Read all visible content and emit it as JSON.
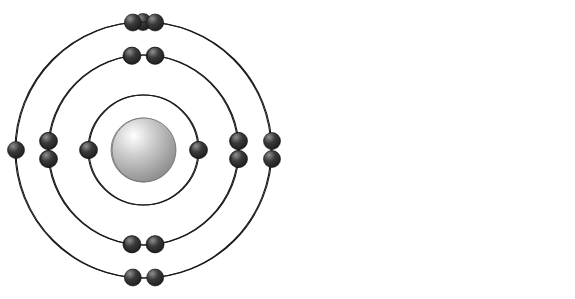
{
  "figure": {
    "background_color": "#ffffff",
    "width": 575,
    "height": 299
  },
  "style": {
    "shell_stroke_color": "#1a1a1a",
    "shell_stroke_width": 1.1,
    "electron_color_dark": "#1c1c1c",
    "electron_color_mid": "#3a3a3a",
    "electron_highlight": "#8f8f8f",
    "electron_radius": 8.5,
    "nucleus_color_light": "#ffffff",
    "nucleus_color_mid": "#cfcfcf",
    "nucleus_color_dark": "#8a8a8a",
    "nucleus_edge": "#6e6e6e"
  },
  "atoms": [
    {
      "id": "atom-left",
      "name": "sodium-atom",
      "label": "Sodium",
      "symbol": "Na",
      "atomic_number": 11,
      "center": {
        "x": 143,
        "y": 150
      },
      "nucleus_radius": 32,
      "electron_configuration": "2-8-1",
      "total_electrons": 11,
      "shells": [
        {
          "index": 1,
          "name": "inner-shell",
          "radius": 55,
          "electron_count": 2,
          "electrons": [
            {
              "angle_deg": 180,
              "pair_offset": 0
            },
            {
              "angle_deg": 0,
              "pair_offset": 0
            }
          ]
        },
        {
          "index": 2,
          "name": "middle-shell",
          "radius": 95,
          "electron_count": 8,
          "electrons": [
            {
              "angle_deg": 97,
              "pair_offset": 0
            },
            {
              "angle_deg": 83,
              "pair_offset": 0
            },
            {
              "angle_deg": 180,
              "pair_offset": -9
            },
            {
              "angle_deg": 180,
              "pair_offset": 9
            },
            {
              "angle_deg": 263,
              "pair_offset": 0
            },
            {
              "angle_deg": 277,
              "pair_offset": 0
            },
            {
              "angle_deg": 0,
              "pair_offset": -9
            },
            {
              "angle_deg": 0,
              "pair_offset": 9
            }
          ]
        },
        {
          "index": 3,
          "name": "outer-shell",
          "radius": 128,
          "electron_count": 1,
          "electrons": [
            {
              "angle_deg": 90,
              "pair_offset": 0
            }
          ]
        }
      ]
    },
    {
      "id": "atom-right",
      "name": "chlorine-atom",
      "label": "Chlorine",
      "symbol": "Cl",
      "atomic_number": 17,
      "center": {
        "x": 144,
        "y": 150
      },
      "nucleus_radius": 32,
      "electron_configuration": "2-8-7",
      "total_electrons": 17,
      "shells": [
        {
          "index": 1,
          "name": "inner-shell",
          "radius": 55,
          "electron_count": 2,
          "electrons": [
            {
              "angle_deg": 180,
              "pair_offset": 0
            },
            {
              "angle_deg": 0,
              "pair_offset": 0
            }
          ]
        },
        {
          "index": 2,
          "name": "middle-shell",
          "radius": 95,
          "electron_count": 8,
          "electrons": [
            {
              "angle_deg": 97,
              "pair_offset": 0
            },
            {
              "angle_deg": 83,
              "pair_offset": 0
            },
            {
              "angle_deg": 180,
              "pair_offset": -9
            },
            {
              "angle_deg": 180,
              "pair_offset": 9
            },
            {
              "angle_deg": 263,
              "pair_offset": 0
            },
            {
              "angle_deg": 277,
              "pair_offset": 0
            },
            {
              "angle_deg": 0,
              "pair_offset": -9
            },
            {
              "angle_deg": 0,
              "pair_offset": 9
            }
          ]
        },
        {
          "index": 3,
          "name": "outer-shell",
          "radius": 128,
          "electron_count": 7,
          "electrons": [
            {
              "angle_deg": 95,
              "pair_offset": 0
            },
            {
              "angle_deg": 85,
              "pair_offset": 0
            },
            {
              "angle_deg": 180,
              "pair_offset": 0
            },
            {
              "angle_deg": 265,
              "pair_offset": 0
            },
            {
              "angle_deg": 275,
              "pair_offset": 0
            },
            {
              "angle_deg": 0,
              "pair_offset": -9
            },
            {
              "angle_deg": 0,
              "pair_offset": 9
            }
          ]
        }
      ]
    }
  ]
}
